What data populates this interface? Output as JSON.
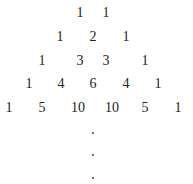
{
  "rows": [
    {
      "y": 13,
      "cells": [
        {
          "v": "1",
          "x": 80
        },
        {
          "v": "1",
          "x": 106
        }
      ]
    },
    {
      "y": 37,
      "cells": [
        {
          "v": "1",
          "x": 60
        },
        {
          "v": "2",
          "x": 93
        },
        {
          "v": "1",
          "x": 126
        }
      ]
    },
    {
      "y": 61,
      "cells": [
        {
          "v": "1",
          "x": 42
        },
        {
          "v": "3",
          "x": 80
        },
        {
          "v": "3",
          "x": 106
        },
        {
          "v": "1",
          "x": 145
        }
      ]
    },
    {
      "y": 84,
      "cells": [
        {
          "v": "1",
          "x": 29
        },
        {
          "v": "4",
          "x": 61
        },
        {
          "v": "6",
          "x": 93
        },
        {
          "v": "4",
          "x": 126
        },
        {
          "v": "1",
          "x": 158
        }
      ]
    },
    {
      "y": 108,
      "cells": [
        {
          "v": "1",
          "x": 9
        },
        {
          "v": "5",
          "x": 42
        },
        {
          "v": "10",
          "x": 78
        },
        {
          "v": "10",
          "x": 112
        },
        {
          "v": "5",
          "x": 145
        },
        {
          "v": "1",
          "x": 178
        }
      ]
    }
  ],
  "continuation_dots": [
    {
      "x": 93,
      "y": 133
    },
    {
      "x": 93,
      "y": 155
    },
    {
      "x": 93,
      "y": 178
    }
  ]
}
